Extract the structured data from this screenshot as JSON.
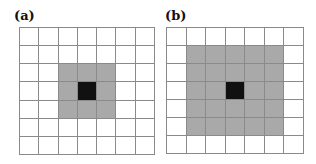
{
  "panels": [
    {
      "label": "(a)",
      "rows": 7,
      "cols": 7,
      "center": [
        3,
        3
      ],
      "neighborhood_radius": 1,
      "neighborhood_size": "3x3",
      "geometry": {
        "left": 19,
        "top": 27,
        "width": 136,
        "height": 128,
        "label_left": 14
      }
    },
    {
      "label": "(b)",
      "rows": 7,
      "cols": 7,
      "center": [
        3,
        3
      ],
      "neighborhood_radius": 2,
      "neighborhood_size": "5x5",
      "geometry": {
        "left": 166,
        "top": 27,
        "width": 138,
        "height": 127,
        "label_left": 165
      }
    }
  ],
  "colors": {
    "grid_line": "#8a8a8a",
    "neighborhood": "#a9a9a9",
    "center": "#111111",
    "empty": "#ffffff"
  }
}
